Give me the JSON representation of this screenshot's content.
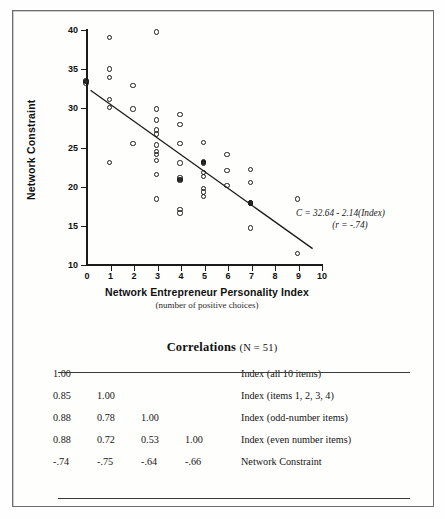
{
  "chart_data": {
    "type": "scatter",
    "title": "",
    "xlabel": "Network Entrepreneur Personality Index",
    "xlabel_sub": "(number of positive choices)",
    "ylabel": "Network Constraint",
    "xlim": [
      0,
      10
    ],
    "ylim": [
      10,
      40
    ],
    "xticks": [
      "0",
      "1",
      "2",
      "3",
      "4",
      "5",
      "6",
      "7",
      "8",
      "9",
      "10"
    ],
    "yticks": [
      "10",
      "15",
      "20",
      "25",
      "30",
      "35",
      "40"
    ],
    "grid": false,
    "legend": "none",
    "marker": "open-circle",
    "annotation_line1": "C = 32.64 - 2.14(Index)",
    "annotation_line2": "(r = -.74)",
    "regression": {
      "slope": -2.14,
      "intercept": 32.64,
      "r": -0.74,
      "x_start": 0.15,
      "y_start": 32.3,
      "x_end": 9.6,
      "y_end": 12.1
    },
    "n": 51,
    "points": [
      {
        "x": 0,
        "y": 33.4
      },
      {
        "x": 0,
        "y": 33.1
      },
      {
        "x": 1,
        "y": 38.9
      },
      {
        "x": 1,
        "y": 34.9
      },
      {
        "x": 1,
        "y": 33.8
      },
      {
        "x": 1,
        "y": 31.0
      },
      {
        "x": 1,
        "y": 30.0
      },
      {
        "x": 1,
        "y": 23.0
      },
      {
        "x": 2,
        "y": 32.8
      },
      {
        "x": 2,
        "y": 29.8
      },
      {
        "x": 2,
        "y": 25.4
      },
      {
        "x": 3,
        "y": 39.6
      },
      {
        "x": 3,
        "y": 29.8
      },
      {
        "x": 3,
        "y": 28.4
      },
      {
        "x": 3,
        "y": 27.1
      },
      {
        "x": 3,
        "y": 26.6
      },
      {
        "x": 3,
        "y": 25.2
      },
      {
        "x": 3,
        "y": 24.4
      },
      {
        "x": 3,
        "y": 24.0
      },
      {
        "x": 3,
        "y": 23.2
      },
      {
        "x": 3,
        "y": 21.4
      },
      {
        "x": 3,
        "y": 18.3
      },
      {
        "x": 4,
        "y": 29.1
      },
      {
        "x": 4,
        "y": 27.8
      },
      {
        "x": 4,
        "y": 25.4
      },
      {
        "x": 4,
        "y": 22.9
      },
      {
        "x": 4,
        "y": 21.0
      },
      {
        "x": 4,
        "y": 20.7
      },
      {
        "x": 4,
        "y": 17.0
      },
      {
        "x": 4,
        "y": 16.5
      },
      {
        "x": 5,
        "y": 25.5
      },
      {
        "x": 5,
        "y": 23.1
      },
      {
        "x": 5,
        "y": 22.9
      },
      {
        "x": 5,
        "y": 21.7
      },
      {
        "x": 5,
        "y": 21.2
      },
      {
        "x": 5,
        "y": 19.6
      },
      {
        "x": 5,
        "y": 19.2
      },
      {
        "x": 5,
        "y": 18.6
      },
      {
        "x": 6,
        "y": 24.0
      },
      {
        "x": 6,
        "y": 21.9
      },
      {
        "x": 6,
        "y": 20.0
      },
      {
        "x": 7,
        "y": 22.1
      },
      {
        "x": 7,
        "y": 20.4
      },
      {
        "x": 7,
        "y": 17.8
      },
      {
        "x": 7,
        "y": 14.6
      },
      {
        "x": 9,
        "y": 18.3
      },
      {
        "x": 9,
        "y": 11.3
      }
    ],
    "dense_points": [
      {
        "x": 0,
        "y": 33.3
      },
      {
        "x": 4,
        "y": 20.8
      },
      {
        "x": 5,
        "y": 23.0
      },
      {
        "x": 7,
        "y": 17.8
      }
    ]
  },
  "table": {
    "title": "Correlations",
    "n_label": "(N = 51)",
    "columns": [
      "c1",
      "c2",
      "c3",
      "c4",
      "label"
    ],
    "rows": [
      {
        "c1": "1.00",
        "c2": "",
        "c3": "",
        "c4": "",
        "label": "Index (all 10 items)"
      },
      {
        "c1": "0.85",
        "c2": "1.00",
        "c3": "",
        "c4": "",
        "label": "Index (items 1, 2, 3, 4)"
      },
      {
        "c1": "0.88",
        "c2": "0.78",
        "c3": "1.00",
        "c4": "",
        "label": "Index (odd-number items)"
      },
      {
        "c1": "0.88",
        "c2": "0.72",
        "c3": "0.53",
        "c4": "1.00",
        "label": "Index (even number items)"
      },
      {
        "c1": "-.74",
        "c2": "-.75",
        "c3": "-.64",
        "c4": "-.66",
        "label": "Network Constraint"
      }
    ]
  },
  "colors": {
    "ink": "#1a1a1a",
    "frame": "#6e6e6e",
    "paper": "#fefefd",
    "rule": "#3a3a3a"
  }
}
